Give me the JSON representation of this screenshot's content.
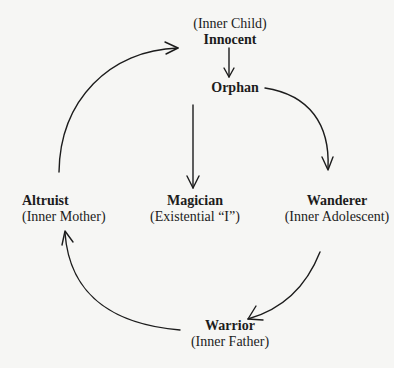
{
  "diagram": {
    "type": "cycle",
    "colors": {
      "background": "#f6f6f4",
      "text": "#1c1c1c",
      "arrow": "#1c1c1c"
    },
    "nodes": {
      "innocent": {
        "name": "Innocent",
        "subtitle": "(Inner Child)"
      },
      "orphan": {
        "name": "Orphan"
      },
      "wanderer": {
        "name": "Wanderer",
        "subtitle": "(Inner Adolescent)"
      },
      "warrior": {
        "name": "Warrior",
        "subtitle": "(Inner Father)"
      },
      "altruist": {
        "name": "Altruist",
        "subtitle": "(Inner Mother)"
      },
      "magician": {
        "name": "Magician",
        "subtitle": "(Existential “I”)"
      }
    },
    "edges": [
      {
        "from": "Innocent",
        "to": "Orphan",
        "style": "straight"
      },
      {
        "from": "Orphan",
        "to": "Wanderer",
        "style": "curved"
      },
      {
        "from": "Wanderer",
        "to": "Warrior",
        "style": "curved"
      },
      {
        "from": "Warrior",
        "to": "Altruist",
        "style": "curved"
      },
      {
        "from": "Altruist",
        "to": "Innocent",
        "style": "curved"
      },
      {
        "from": "Orphan",
        "to": "Magician",
        "style": "straight"
      }
    ]
  }
}
